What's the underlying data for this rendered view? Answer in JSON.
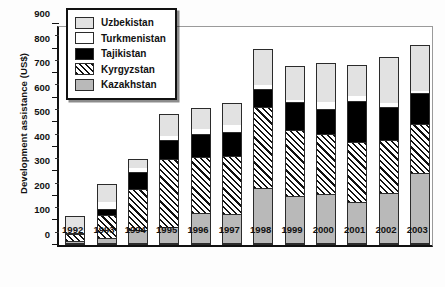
{
  "chart_data": {
    "type": "bar",
    "subtype": "stacked-bar",
    "title": "",
    "xlabel": "",
    "ylabel": "Development assistance (US$)",
    "ylim": [
      0,
      900
    ],
    "ytick_step": 100,
    "yticks": [
      0,
      100,
      200,
      300,
      400,
      500,
      600,
      700,
      800,
      900
    ],
    "minor_ytick_step": 50,
    "grid": false,
    "legend_position": "top-left-inside",
    "categories": [
      "1992",
      "1993",
      "1994",
      "1995",
      "1996",
      "1997",
      "1998",
      "1999",
      "2000",
      "2001",
      "2002",
      "2003"
    ],
    "series": [
      {
        "name": "Kazakhstan",
        "values": [
          10,
          20,
          55,
          65,
          125,
          120,
          225,
          195,
          200,
          170,
          205,
          290
        ]
      },
      {
        "name": "Kyrgyzstan",
        "values": [
          30,
          100,
          170,
          283,
          230,
          240,
          335,
          270,
          250,
          245,
          220,
          200
        ]
      },
      {
        "name": "Tajikistan",
        "values": [
          5,
          25,
          70,
          77,
          95,
          100,
          75,
          115,
          100,
          170,
          135,
          125
        ]
      },
      {
        "name": "Turkmenistan",
        "values": [
          10,
          30,
          20,
          20,
          25,
          30,
          20,
          15,
          35,
          25,
          20,
          15
        ]
      },
      {
        "name": "Uzbekistan",
        "values": [
          63,
          75,
          35,
          87,
          82,
          90,
          145,
          135,
          155,
          125,
          185,
          185
        ]
      }
    ],
    "totals": [
      118,
      250,
      350,
      532,
      557,
      580,
      800,
      730,
      740,
      735,
      765,
      815
    ],
    "stack_order_bottom_to_top": [
      "Kazakhstan",
      "Kyrgyzstan",
      "Tajikistan",
      "Turkmenistan",
      "Uzbekistan"
    ],
    "series_styles": {
      "Uzbekistan": {
        "fill": "#e2e2e2",
        "pattern": "solid-light-gray"
      },
      "Turkmenistan": {
        "fill": "#ffffff",
        "pattern": "solid-white"
      },
      "Tajikistan": {
        "fill": "#000000",
        "pattern": "solid-black"
      },
      "Kyrgyzstan": {
        "fill": "#ffffff",
        "pattern": "diagonal-hatch"
      },
      "Kazakhstan": {
        "fill": "#b9b9b9",
        "pattern": "solid-gray"
      }
    }
  },
  "legend": {
    "items": [
      {
        "label": "Uzbekistan",
        "key": "Uzbekistan"
      },
      {
        "label": "Turkmenistan",
        "key": "Turkmenistan"
      },
      {
        "label": "Tajikistan",
        "key": "Tajikistan"
      },
      {
        "label": "Kyrgyzstan",
        "key": "Kyrgyzstan"
      },
      {
        "label": "Kazakhstan",
        "key": "Kazakhstan"
      }
    ]
  }
}
